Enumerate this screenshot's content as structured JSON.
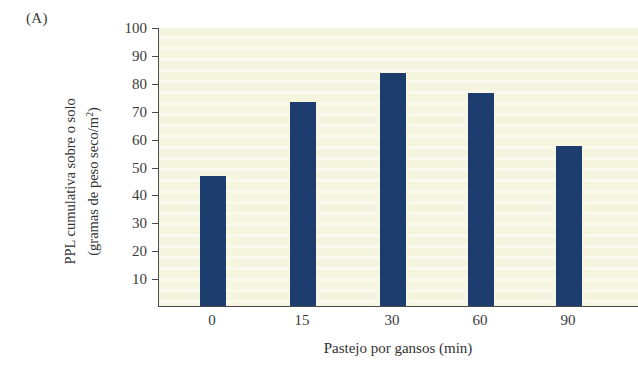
{
  "figure": {
    "panel_label": "(A)",
    "bar_color": "#1c3d6e",
    "plot_background": "#f6f6e0",
    "axis_color": "#4a4a4a"
  },
  "chart_data": {
    "type": "bar",
    "title": "",
    "panel": "(A)",
    "categories": [
      "0",
      "15",
      "30",
      "60",
      "90"
    ],
    "values": [
      46.5,
      73,
      83.5,
      76.5,
      57.5
    ],
    "xlabel": "Pastejo por gansos (min)",
    "ylabel_line1": "PPL cumulativa sobre o solo",
    "ylabel_line2": "(gramas de peso seco/m",
    "ylabel_exponent": "2",
    "ylabel_line2_close": ")",
    "ylabel_full": "PPL cumulativa sobre o solo (gramas de peso seco/m²)",
    "ylim": [
      0,
      100
    ],
    "yticks": [
      10,
      20,
      30,
      40,
      50,
      60,
      70,
      80,
      90,
      100
    ],
    "ytick_labels": [
      "10",
      "20",
      "30",
      "40",
      "50",
      "60",
      "70",
      "80",
      "90",
      "100"
    ],
    "grid": false,
    "legend": null,
    "series": [
      {
        "name": "PPL cumulativa sobre o solo",
        "values": [
          46.5,
          73,
          83.5,
          76.5,
          57.5
        ]
      }
    ]
  }
}
